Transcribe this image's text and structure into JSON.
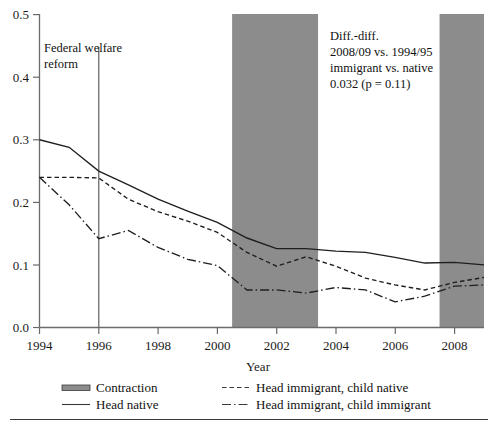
{
  "chart_data": {
    "type": "line",
    "title": "",
    "xlabel": "Year",
    "ylabel": "",
    "xlim": [
      1994,
      2009
    ],
    "ylim": [
      0.0,
      0.5
    ],
    "grid": false,
    "legend_position": "bottom",
    "x": [
      1994,
      1995,
      1996,
      1997,
      1998,
      1999,
      2000,
      2001,
      2002,
      2003,
      2004,
      2005,
      2006,
      2007,
      2008,
      2009
    ],
    "xticks": [
      "1994",
      "1996",
      "1998",
      "2000",
      "2002",
      "2004",
      "2006",
      "2008"
    ],
    "xtick_values": [
      1994,
      1996,
      1998,
      2000,
      2002,
      2004,
      2006,
      2008
    ],
    "yticks": [
      "0.0",
      "0.1",
      "0.2",
      "0.3",
      "0.4",
      "0.5"
    ],
    "ytick_values": [
      0.0,
      0.1,
      0.2,
      0.3,
      0.4,
      0.5
    ],
    "series": [
      {
        "name": "Head native",
        "style": "solid",
        "color": "#1f1f1f",
        "values": [
          0.3,
          0.288,
          0.25,
          0.228,
          0.205,
          0.186,
          0.168,
          0.143,
          0.126,
          0.126,
          0.122,
          0.12,
          0.112,
          0.103,
          0.104,
          0.1
        ]
      },
      {
        "name": "Head immigrant, child native",
        "style": "dashed",
        "color": "#1f1f1f",
        "values": [
          0.24,
          0.24,
          0.239,
          0.205,
          0.185,
          0.17,
          0.152,
          0.12,
          0.098,
          0.113,
          0.098,
          0.079,
          0.068,
          0.06,
          0.072,
          0.08
        ]
      },
      {
        "name": "Head immigrant, child immigrant",
        "style": "dashdot",
        "color": "#1f1f1f",
        "values": [
          0.24,
          0.196,
          0.142,
          0.155,
          0.128,
          0.109,
          0.099,
          0.06,
          0.06,
          0.055,
          0.064,
          0.06,
          0.041,
          0.05,
          0.066,
          0.068
        ]
      }
    ],
    "shaded_bands": [
      {
        "label": "Contraction",
        "start": 2000.5,
        "end": 2003.4,
        "color": "#8c8c8c"
      },
      {
        "label": "Contraction",
        "start": 2007.5,
        "end": 2009.0,
        "color": "#8c8c8c"
      }
    ],
    "vertical_lines": [
      {
        "x": 1996,
        "label": "Federal welfare reform"
      }
    ],
    "annotations": [
      {
        "name": "diff-diff-note",
        "lines": [
          "Diff.-diff.",
          "2008/09 vs. 1994/95",
          "immigrant vs. native",
          "0.032 (p = 0.11)"
        ],
        "x": 2003.7,
        "y": 0.48
      },
      {
        "name": "welfare-reform-note",
        "lines": [
          "Federal welfare",
          "reform"
        ],
        "x": 1994.6,
        "y": 0.465
      }
    ]
  },
  "legend": {
    "items": [
      {
        "label": "Contraction",
        "marker": "block"
      },
      {
        "label": "Head native",
        "marker": "solid"
      },
      {
        "label": "Head immigrant, child native",
        "marker": "dashed"
      },
      {
        "label": "Head immigrant, child immigrant",
        "marker": "dashdot"
      }
    ]
  }
}
